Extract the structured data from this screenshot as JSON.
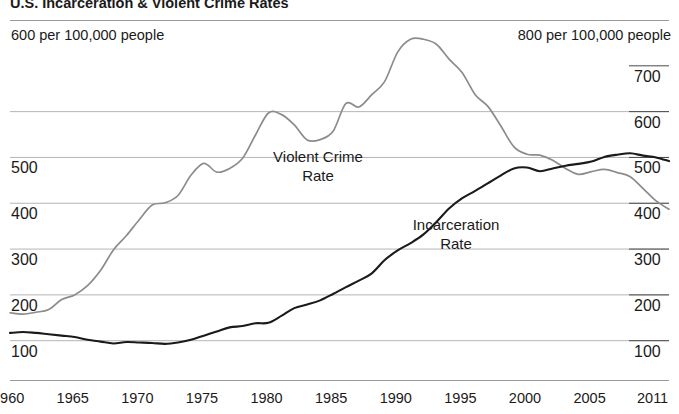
{
  "title": "U.S. Incarceration & Violent Crime Rates",
  "header": {
    "left_unit": "600 per 100,000 people",
    "right_unit": "800 per 100,000 people"
  },
  "axes": {
    "left_ticks": [
      "500",
      "400",
      "300",
      "200",
      "100"
    ],
    "right_ticks": [
      "700",
      "600",
      "500",
      "400",
      "300",
      "200",
      "100"
    ],
    "x_ticks": [
      "1960",
      "1965",
      "1970",
      "1975",
      "1980",
      "1985",
      "1990",
      "1995",
      "2000",
      "2005",
      "2011"
    ]
  },
  "labels": {
    "violent_crime": "Violent Crime\nRate",
    "incarceration": "Incarceration\nRate"
  },
  "colors": {
    "violent_crime": "#8c8c8c",
    "incarceration": "#1a1a1a",
    "grid": "#b5b5b5",
    "rule": "#9a9a9a",
    "background": "#ffffff"
  },
  "chart_data": {
    "type": "line",
    "title": "U.S. Incarceration & Violent Crime Rates",
    "xlabel": "",
    "ylabel": "",
    "grid": true,
    "legend": "inline-annotations",
    "xlim": [
      1960,
      2011
    ],
    "axis_left": {
      "name": "Violent Crime Rate (per 100,000 people)",
      "range": [
        0,
        800
      ],
      "ticks": [
        100,
        200,
        300,
        400,
        500,
        600
      ]
    },
    "axis_right": {
      "name": "Incarceration Rate (per 100,000 people)",
      "range": [
        0,
        800
      ],
      "ticks": [
        100,
        200,
        300,
        400,
        500,
        600,
        700,
        800
      ]
    },
    "x": [
      1960,
      1961,
      1962,
      1963,
      1964,
      1965,
      1966,
      1967,
      1968,
      1969,
      1970,
      1971,
      1972,
      1973,
      1974,
      1975,
      1976,
      1977,
      1978,
      1979,
      1980,
      1981,
      1982,
      1983,
      1984,
      1985,
      1986,
      1987,
      1988,
      1989,
      1990,
      1991,
      1992,
      1993,
      1994,
      1995,
      1996,
      1997,
      1998,
      1999,
      2000,
      2001,
      2002,
      2003,
      2004,
      2005,
      2006,
      2007,
      2008,
      2009,
      2010,
      2011
    ],
    "series": [
      {
        "name": "Violent Crime Rate",
        "axis": "left",
        "color": "#8c8c8c",
        "values": [
          161,
          158,
          162,
          168,
          190,
          200,
          220,
          253,
          298,
          329,
          364,
          396,
          401,
          417,
          461,
          487,
          468,
          476,
          498,
          549,
          597,
          594,
          571,
          538,
          539,
          557,
          618,
          610,
          637,
          666,
          730,
          758,
          758,
          747,
          714,
          685,
          637,
          611,
          568,
          523,
          507,
          505,
          494,
          476,
          463,
          469,
          474,
          467,
          458,
          432,
          405,
          387
        ]
      },
      {
        "name": "Incarceration Rate",
        "axis": "right",
        "color": "#1a1a1a",
        "values": [
          117,
          119,
          117,
          114,
          111,
          108,
          102,
          98,
          94,
          97,
          96,
          95,
          93,
          96,
          102,
          111,
          120,
          129,
          132,
          138,
          139,
          154,
          171,
          179,
          188,
          202,
          217,
          231,
          247,
          276,
          297,
          313,
          332,
          359,
          389,
          411,
          427,
          444,
          461,
          476,
          478,
          470,
          476,
          482,
          486,
          491,
          501,
          506,
          509,
          504,
          500,
          492
        ]
      }
    ],
    "annotations": [
      {
        "text": "Violent Crime Rate",
        "x": 1984,
        "y": 440
      },
      {
        "text": "Incarceration Rate",
        "x": 1997,
        "y": 290
      }
    ]
  }
}
